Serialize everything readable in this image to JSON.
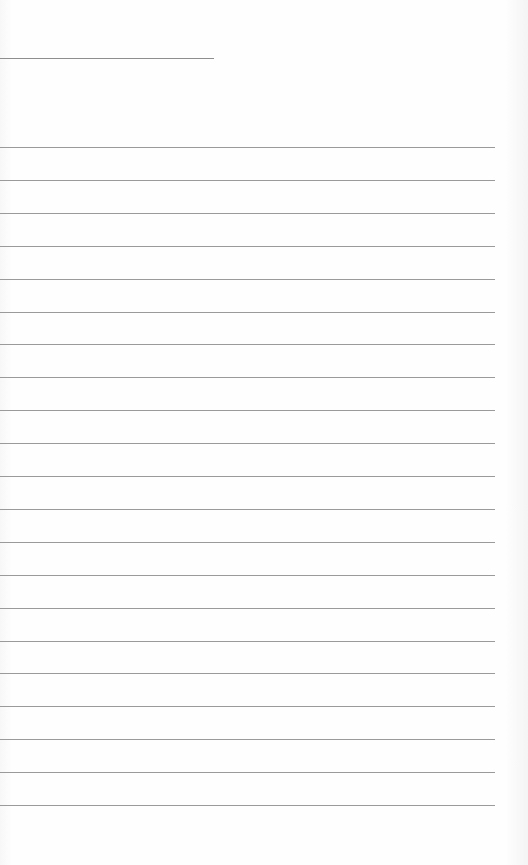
{
  "page": {
    "type": "lined-notebook-page",
    "background_color": "#fdfdfd",
    "line_color": "#9a9a9a",
    "title_line": {
      "top": 58,
      "width": 214
    },
    "rules": {
      "count": 21,
      "first_top": 147,
      "spacing": 32.9,
      "width": 495
    }
  }
}
